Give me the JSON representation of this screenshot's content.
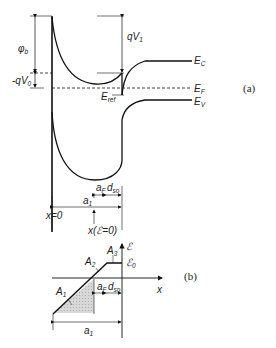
{
  "figure_a": {
    "tag": "(a)",
    "labels": {
      "phi_b": "φ",
      "phi_b_sub": "b",
      "neg_qV0": "-qV",
      "neg_qV0_sub": "0",
      "qV1": "qV",
      "qV1_sub": "1",
      "E_C": "E",
      "E_C_sub": "C",
      "E_F": "E",
      "E_F_sub": "F",
      "E_V": "E",
      "E_V_sub": "V",
      "E_ref": "E",
      "E_ref_sub": "ref",
      "a_F": "a",
      "a_F_sub": "F",
      "d_so": "d",
      "d_so_sub": "so",
      "a_1": "a",
      "a_1_sub": "1",
      "x0": "x=0",
      "x_field_zero": "x(ℰ=0)"
    }
  },
  "figure_b": {
    "tag": "(b)",
    "labels": {
      "field_axis": "ℰ",
      "field_0": "ℰ",
      "field_0_sub": "0",
      "x_axis": "x",
      "A1": "A",
      "A1_sub": "1",
      "A2": "A",
      "A2_sub": "2",
      "A3": "A",
      "A3_sub": "3",
      "a_F": "a",
      "a_F_sub": "F",
      "d_so": "d",
      "d_so_sub": "so",
      "a_1": "a",
      "a_1_sub": "1"
    }
  },
  "colors": {
    "line": "#111111",
    "shade": "#cfcfcf"
  }
}
